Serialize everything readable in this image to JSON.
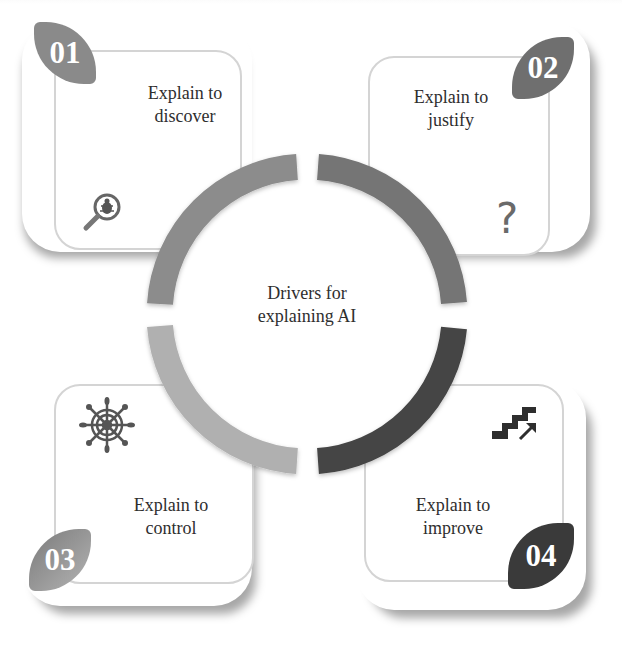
{
  "diagram": {
    "title": "Drivers for explaining AI",
    "center_label_line1": "Drivers for",
    "center_label_line2": "explaining AI",
    "colors": {
      "card1": "#8a8a8a",
      "card2": "#6f6f6f",
      "card3": "#a8a8a8",
      "card4": "#3a3a3a",
      "ring_top_left": "#8c8c8c",
      "ring_top_right": "#757575",
      "ring_bottom_left": "#b0b0b0",
      "ring_bottom_right": "#444444"
    },
    "cards": [
      {
        "number": "01",
        "line1": "Explain to",
        "line2": "discover",
        "icon": "magnifier-bug-icon"
      },
      {
        "number": "02",
        "line1": "Explain to",
        "line2": "justify",
        "icon": "question-mark-icon",
        "icon_glyph": "?"
      },
      {
        "number": "03",
        "line1": "Explain to",
        "line2": "control",
        "icon": "ship-wheel-icon"
      },
      {
        "number": "04",
        "line1": "Explain to",
        "line2": "improve",
        "icon": "stairs-up-arrow-icon"
      }
    ]
  }
}
